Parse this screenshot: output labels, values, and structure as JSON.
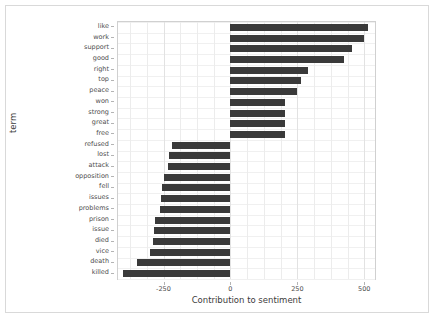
{
  "chart_data": {
    "type": "bar",
    "orientation": "horizontal",
    "title": "",
    "xlabel": "Contribution to sentiment",
    "ylabel": "term",
    "xlim": [
      -420,
      540
    ],
    "xticks": [
      -250,
      0,
      250,
      500
    ],
    "xticklabels": [
      "-250",
      "0",
      "250",
      "500"
    ],
    "grid": true,
    "legend": null,
    "bar_color": "#3a3a3a",
    "categories": [
      "like",
      "work",
      "support",
      "good",
      "right",
      "top",
      "peace",
      "won",
      "strong",
      "great",
      "free",
      "refused",
      "lost",
      "attack",
      "opposition",
      "fell",
      "issues",
      "problems",
      "prison",
      "issue",
      "died",
      "vice",
      "death",
      "killed"
    ],
    "values": [
      515,
      500,
      455,
      425,
      290,
      265,
      250,
      205,
      205,
      205,
      203,
      -220,
      -228,
      -232,
      -250,
      -255,
      -258,
      -262,
      -280,
      -285,
      -288,
      -300,
      -350,
      -400
    ]
  },
  "caption": ""
}
